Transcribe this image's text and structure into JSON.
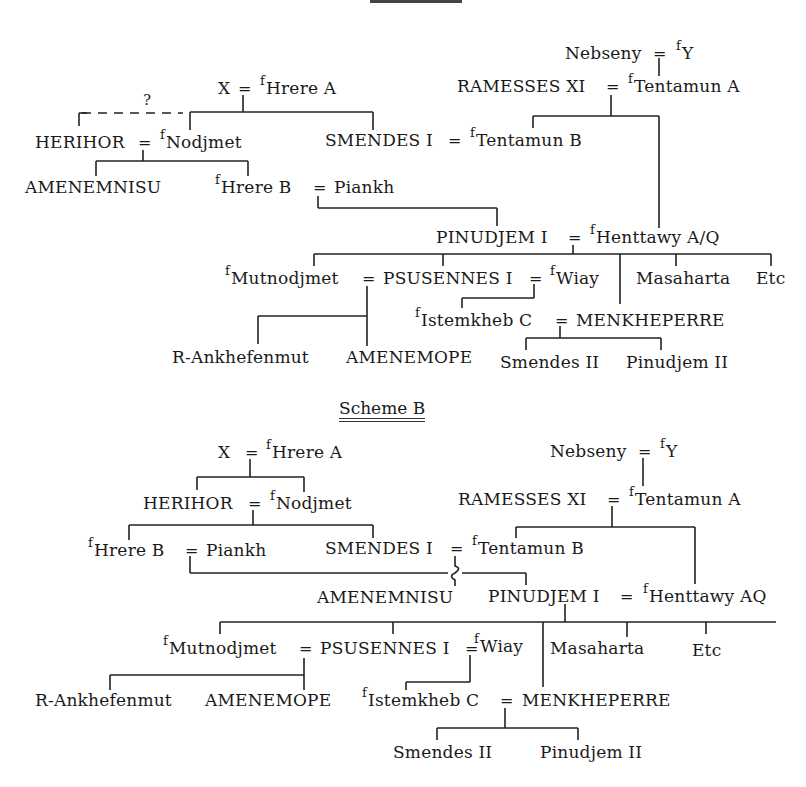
{
  "scheme_a": {
    "heading": "Scheme A",
    "people": {
      "x": "X",
      "hrere_a": "Hrere A",
      "nebseny": "Nebseny",
      "y": "Y",
      "ramesses_xi": "RAMESSES XI",
      "tentamun_a": "Tentamun A",
      "herihor": "HERIHOR",
      "nodjmet": "Nodjmet",
      "smendes_i": "SMENDES I",
      "tentamun_b": "Tentamun B",
      "amenemnisu": "AMENEMNISU",
      "hrere_b": "Hrere B",
      "piankh": "Piankh",
      "pinudjem_i": "PINUDJEM I",
      "henttawy": "Henttawy A/Q",
      "mutnodjmet": "Mutnodjmet",
      "psusennes_i": "PSUSENNES I",
      "wiay": "Wiay",
      "masaharta": "Masaharta",
      "etc": "Etc",
      "istemkheb_c": "Istemkheb C",
      "menkheperre": "MENKHEPERRE",
      "r_ankhefenmut": "R-Ankhefenmut",
      "amenemope": "AMENEMOPE",
      "smendes_ii": "Smendes II",
      "pinudjem_ii": "Pinudjem II"
    },
    "uncertain_mark": "?"
  },
  "scheme_b": {
    "heading": "Scheme B",
    "people": {
      "x": "X",
      "hrere_a": "Hrere A",
      "nebseny": "Nebseny",
      "y": "Y",
      "herihor": "HERIHOR",
      "nodjmet": "Nodjmet",
      "ramesses_xi": "RAMESSES XI",
      "tentamun_a": "Tentamun A",
      "hrere_b": "Hrere B",
      "piankh": "Piankh",
      "smendes_i": "SMENDES I",
      "tentamun_b": "Tentamun B",
      "amenemnisu": "AMENEMNISU",
      "pinudjem_i": "PINUDJEM I",
      "henttawy": "Henttawy AQ",
      "mutnodjmet": "Mutnodjmet",
      "psusennes_i": "PSUSENNES I",
      "wiay": "Wiay",
      "masaharta": "Masaharta",
      "etc": "Etc",
      "r_ankhefenmut": "R-Ankhefenmut",
      "amenemope": "AMENEMOPE",
      "istemkheb_c": "Istemkheb C",
      "menkheperre": "MENKHEPERRE",
      "smendes_ii": "Smendes II",
      "pinudjem_ii": "Pinudjem II"
    }
  },
  "symbols": {
    "marriage": "=",
    "female_prefix": "f"
  }
}
